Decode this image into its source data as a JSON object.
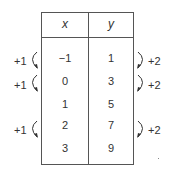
{
  "table": {
    "headers": [
      "x",
      "y"
    ],
    "rows": [
      {
        "x": "−1",
        "y": "1"
      },
      {
        "x": "0",
        "y": "3"
      },
      {
        "x": "1",
        "y": "5"
      },
      {
        "x": "2",
        "y": "7"
      },
      {
        "x": "3",
        "y": "9"
      }
    ]
  },
  "annotations": {
    "left": [
      "+1",
      "+1",
      "+1"
    ],
    "right": [
      "+2",
      "+2",
      "+2"
    ]
  }
}
